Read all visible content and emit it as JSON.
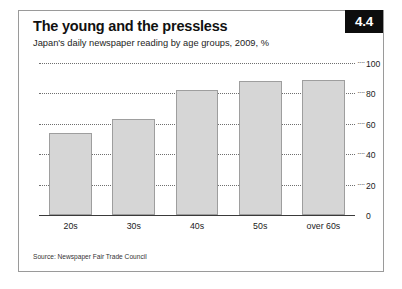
{
  "figure": {
    "badge": "4.4",
    "title": "The young and the pressless",
    "subtitle": "Japan's daily newspaper reading by age groups, 2009, %",
    "source": "Source: Newspaper Fair Trade Council"
  },
  "chart_data": {
    "type": "bar",
    "title": "The young and the pressless",
    "subtitle": "Japan's daily newspaper reading by age groups, 2009, %",
    "categories": [
      "20s",
      "30s",
      "40s",
      "50s",
      "over 60s"
    ],
    "values": [
      54,
      63,
      82,
      88,
      89
    ],
    "series": [
      {
        "name": "Daily newspaper reading",
        "values": [
          54,
          63,
          82,
          88,
          89
        ]
      }
    ],
    "xlabel": "",
    "ylabel": "%",
    "ylim": [
      0,
      100
    ],
    "yticks": [
      0,
      20,
      40,
      60,
      80,
      100
    ],
    "ytick_labels": [
      "0",
      "20",
      "40",
      "60",
      "80",
      "100"
    ],
    "grid": true,
    "grid_style": "dotted",
    "axis_position": "right",
    "legend": "none",
    "bar_fill": "#d6d6d6",
    "bar_stroke": "#9e9e9e",
    "source": "Source: Newspaper Fair Trade Council"
  }
}
